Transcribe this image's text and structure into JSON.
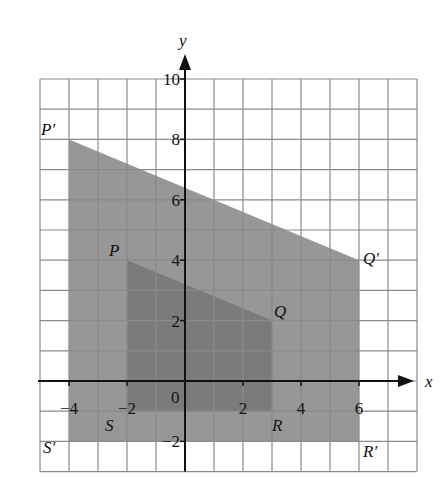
{
  "diagram": {
    "type": "coordinate-grid-enlargement",
    "axes": {
      "x_label": "x",
      "y_label": "y",
      "x_range": [
        -5,
        8
      ],
      "y_range": [
        -3,
        10
      ],
      "x_ticks": [
        {
          "value": -4,
          "label": "-4"
        },
        {
          "value": -2,
          "label": "-2"
        },
        {
          "value": 2,
          "label": "2"
        },
        {
          "value": 4,
          "label": "4"
        },
        {
          "value": 6,
          "label": "6"
        }
      ],
      "y_ticks": [
        {
          "value": 10,
          "label": "10"
        },
        {
          "value": 8,
          "label": "8"
        },
        {
          "value": 6,
          "label": "6"
        },
        {
          "value": 4,
          "label": "4"
        },
        {
          "value": 2,
          "label": "2"
        },
        {
          "value": -2,
          "label": "-2"
        }
      ],
      "origin_label": "0"
    },
    "shapes": [
      {
        "name": "image",
        "fill": "#979797",
        "vertices": [
          {
            "label": "P′",
            "x": -4,
            "y": 8
          },
          {
            "label": "Q′",
            "x": 6,
            "y": 4
          },
          {
            "label": "R′",
            "x": 6,
            "y": -2
          },
          {
            "label": "S′",
            "x": -4,
            "y": -2
          }
        ]
      },
      {
        "name": "object",
        "fill": "#7b7b7b",
        "vertices": [
          {
            "label": "P",
            "x": -2,
            "y": 4
          },
          {
            "label": "Q",
            "x": 3,
            "y": 2
          },
          {
            "label": "R",
            "x": 3,
            "y": -1
          },
          {
            "label": "S",
            "x": -2,
            "y": -1
          }
        ]
      }
    ],
    "colors": {
      "grid_line": "#8a8a8a",
      "axis": "#111111",
      "background": "#ffffff"
    }
  }
}
